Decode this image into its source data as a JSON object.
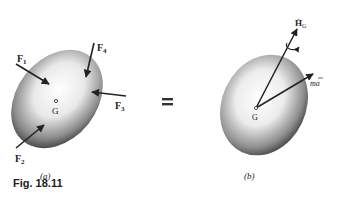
{
  "figure": {
    "caption": "Fig. 18.11",
    "equals_sign": "="
  },
  "panel_a": {
    "label": "(a)",
    "center_label": "G",
    "forces": [
      {
        "name": "F",
        "sub": "1"
      },
      {
        "name": "F",
        "sub": "2"
      },
      {
        "name": "F",
        "sub": "3"
      },
      {
        "name": "F",
        "sub": "4"
      }
    ]
  },
  "panel_b": {
    "label": "(b)",
    "center_label": "G",
    "angular_momentum_rate": {
      "name": "Ḣ",
      "sub": "G"
    },
    "linear_term": "ma",
    "linear_term_bar": "¯"
  },
  "colors": {
    "ink": "#222222",
    "body_dark": "#3a3a3a",
    "body_light": "#f4f4f4"
  }
}
